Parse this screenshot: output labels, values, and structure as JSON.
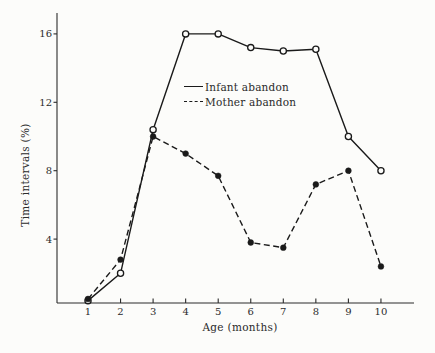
{
  "figure": {
    "background": "#fcfcfa",
    "ink": "#1a1a1a",
    "axis_color": "#2b2b2b"
  },
  "chart_data": {
    "type": "line",
    "title": "",
    "xlabel": "Age (months)",
    "ylabel": "Time intervals (%)",
    "x": [
      1,
      2,
      3,
      4,
      5,
      6,
      7,
      8,
      9,
      10
    ],
    "x_ticks": [
      1,
      2,
      3,
      4,
      5,
      6,
      7,
      8,
      9,
      10
    ],
    "y_ticks": [
      4,
      8,
      12,
      16
    ],
    "xlim": [
      0,
      11
    ],
    "ylim": [
      0,
      17.2
    ],
    "grid": false,
    "legend_position": "upper-center-inside",
    "series": [
      {
        "name": "Infant abandon",
        "line_style": "solid",
        "marker": "open-circle",
        "values": [
          0.4,
          2.0,
          10.4,
          16.0,
          16.0,
          15.2,
          15.0,
          15.1,
          10.0,
          8.0
        ]
      },
      {
        "name": "Mother abandon",
        "line_style": "dashed",
        "marker": "filled-circle",
        "values": [
          0.5,
          2.8,
          10.0,
          9.0,
          7.7,
          3.8,
          3.5,
          7.2,
          8.0,
          2.4
        ]
      }
    ]
  }
}
